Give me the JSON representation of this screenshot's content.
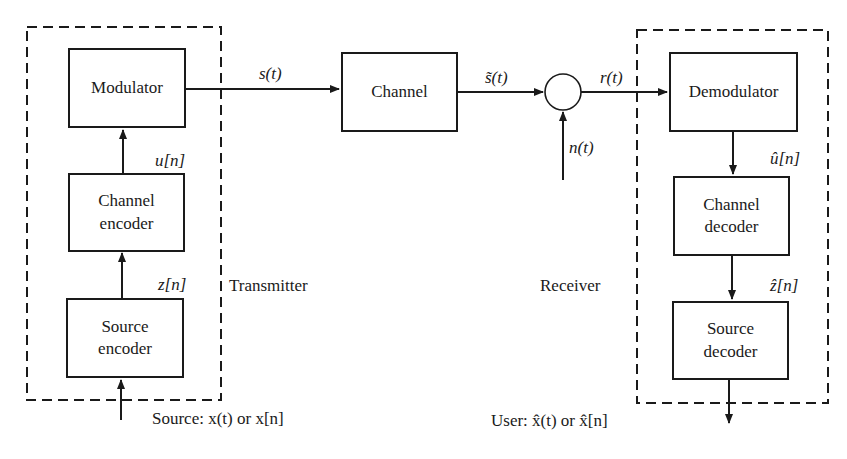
{
  "diagram": {
    "transmitter": {
      "label": "Transmitter",
      "blocks": {
        "modulator": "Modulator",
        "channel_encoder": "Channel\nencoder",
        "source_encoder": "Source\nencoder"
      },
      "signals": {
        "u": "u[n]",
        "z": "z[n]"
      }
    },
    "channel": {
      "label": "Channel",
      "input_signal": "s(t)",
      "output_signal": "s̃(t)"
    },
    "noise": {
      "signal": "n(t)",
      "summed_output": "r(t)"
    },
    "receiver": {
      "label": "Receiver",
      "blocks": {
        "demodulator": "Demodulator",
        "channel_decoder": "Channel\ndecoder",
        "source_decoder": "Source\ndecoder"
      },
      "signals": {
        "u_hat": "û[n]",
        "z_hat": "ẑ[n]"
      }
    },
    "source_label": "Source: x(t) or x[n]",
    "user_label": "User: x̂(t) or x̂[n]",
    "colors": {
      "stroke": "#1a1a1a",
      "background": "#ffffff"
    }
  }
}
